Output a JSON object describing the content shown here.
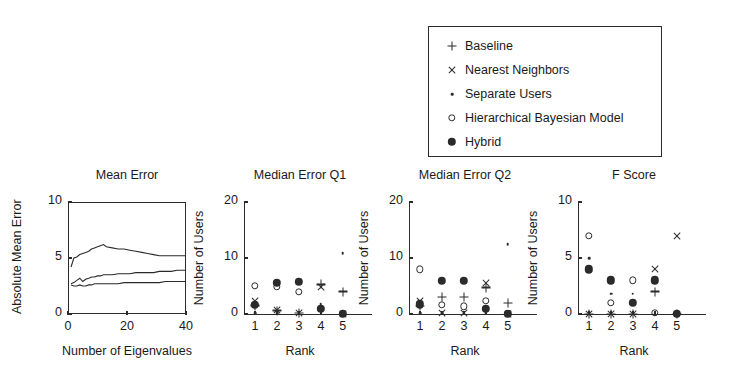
{
  "legend": {
    "items": [
      {
        "marker": "plus-icon",
        "label": "Baseline"
      },
      {
        "marker": "cross-icon",
        "label": "Nearest Neighbors"
      },
      {
        "marker": "dot-icon",
        "label": "Separate Users"
      },
      {
        "marker": "open-circle-icon",
        "label": "Hierarchical Bayesian Model"
      },
      {
        "marker": "filled-circle-icon",
        "label": "Hybrid"
      }
    ]
  },
  "chart_data": [
    {
      "type": "line",
      "title": "Mean Error",
      "xlabel": "Number of Eigenvalues",
      "ylabel": "Absolute Mean Error",
      "xlim": [
        0,
        40
      ],
      "ylim": [
        0,
        10
      ],
      "xticks": [
        0,
        20,
        40
      ],
      "xtick_labels": [
        "0",
        "20",
        "40"
      ],
      "yticks": [
        0,
        5,
        10
      ],
      "ytick_labels": [
        "0",
        "5",
        "10"
      ],
      "grid": false,
      "frame": "box",
      "series": [
        {
          "name": "upper",
          "x": [
            1,
            2,
            3,
            4,
            5,
            6,
            7,
            8,
            9,
            10,
            11,
            12,
            13,
            15,
            17,
            19,
            21,
            23,
            25,
            27,
            29,
            31,
            33,
            35,
            37,
            39,
            40
          ],
          "y": [
            4.2,
            5.0,
            5.1,
            5.3,
            5.4,
            5.5,
            5.6,
            5.8,
            5.9,
            6.0,
            6.1,
            6.2,
            6.0,
            5.9,
            5.8,
            5.8,
            5.7,
            5.6,
            5.5,
            5.4,
            5.3,
            5.2,
            5.2,
            5.2,
            5.2,
            5.2,
            5.2
          ]
        },
        {
          "name": "middle",
          "x": [
            1,
            2,
            3,
            4,
            5,
            6,
            7,
            8,
            9,
            10,
            11,
            12,
            13,
            15,
            17,
            19,
            21,
            23,
            25,
            27,
            29,
            31,
            33,
            35,
            37,
            39,
            40
          ],
          "y": [
            2.7,
            2.8,
            3.0,
            3.2,
            2.9,
            3.1,
            3.2,
            3.3,
            3.3,
            3.4,
            3.4,
            3.5,
            3.5,
            3.5,
            3.6,
            3.6,
            3.6,
            3.7,
            3.7,
            3.7,
            3.7,
            3.8,
            3.8,
            3.8,
            3.9,
            3.9,
            3.9
          ]
        },
        {
          "name": "lower",
          "x": [
            1,
            2,
            3,
            4,
            5,
            6,
            7,
            8,
            9,
            10,
            11,
            12,
            13,
            15,
            17,
            19,
            21,
            23,
            25,
            27,
            29,
            31,
            33,
            35,
            37,
            39,
            40
          ],
          "y": [
            2.6,
            2.5,
            2.5,
            2.6,
            2.5,
            2.5,
            2.6,
            2.6,
            2.7,
            2.7,
            2.7,
            2.7,
            2.7,
            2.7,
            2.7,
            2.8,
            2.8,
            2.8,
            2.8,
            2.8,
            2.8,
            2.8,
            2.9,
            2.9,
            2.9,
            2.9,
            2.9
          ]
        }
      ]
    },
    {
      "type": "scatter",
      "title": "Median Error Q1",
      "xlabel": "Rank",
      "ylabel": "Number of Users",
      "xlim": [
        0.5,
        5.6
      ],
      "ylim": [
        0,
        20
      ],
      "xticks": [
        1,
        2,
        3,
        4,
        5
      ],
      "xtick_labels": [
        "1",
        "2",
        "3",
        "4",
        "5"
      ],
      "yticks": [
        0,
        10,
        20
      ],
      "ytick_labels": [
        "0",
        "10",
        "20"
      ],
      "grid": false,
      "frame": "L",
      "categories": [
        1,
        2,
        3,
        4,
        5
      ],
      "series": [
        {
          "name": "Baseline",
          "marker": "plus-icon",
          "values": [
            1.5,
            0.6,
            0.2,
            5.3,
            4.0
          ]
        },
        {
          "name": "Nearest Neighbors",
          "marker": "cross-icon",
          "values": [
            2.3,
            0.8,
            0.2,
            4.8,
            0.0
          ]
        },
        {
          "name": "Separate Users",
          "marker": "dot-icon",
          "values": [
            0.1,
            0.1,
            0.1,
            1.7,
            10.9
          ]
        },
        {
          "name": "Hierarchical Bayesian Model",
          "marker": "open-circle-icon",
          "values": [
            5.0,
            4.9,
            4.0,
            0.9,
            0.0
          ]
        },
        {
          "name": "Hybrid",
          "marker": "filled-circle-icon",
          "values": [
            1.6,
            5.6,
            5.8,
            0.9,
            0.0
          ]
        }
      ]
    },
    {
      "type": "scatter",
      "title": "Median Error Q2",
      "xlabel": "Rank",
      "ylabel": "Number of Users",
      "xlim": [
        0.5,
        5.6
      ],
      "ylim": [
        0,
        20
      ],
      "xticks": [
        1,
        2,
        3,
        4,
        5
      ],
      "xtick_labels": [
        "1",
        "2",
        "3",
        "4",
        "5"
      ],
      "yticks": [
        0,
        10,
        20
      ],
      "ytick_labels": [
        "0",
        "10",
        "20"
      ],
      "grid": false,
      "frame": "L",
      "categories": [
        1,
        2,
        3,
        4,
        5
      ],
      "series": [
        {
          "name": "Baseline",
          "marker": "plus-icon",
          "values": [
            1.4,
            3.0,
            3.0,
            4.7,
            2.0
          ]
        },
        {
          "name": "Nearest Neighbors",
          "marker": "cross-icon",
          "values": [
            2.3,
            0.1,
            0.1,
            5.5,
            0.0
          ]
        },
        {
          "name": "Separate Users",
          "marker": "dot-icon",
          "values": [
            0.1,
            0.1,
            0.1,
            0.1,
            12.5
          ]
        },
        {
          "name": "Hierarchical Bayesian Model",
          "marker": "open-circle-icon",
          "values": [
            8.0,
            1.6,
            1.4,
            2.4,
            0.0
          ]
        },
        {
          "name": "Hybrid",
          "marker": "filled-circle-icon",
          "values": [
            1.7,
            5.9,
            5.9,
            0.9,
            0.0
          ]
        }
      ]
    },
    {
      "type": "scatter",
      "title": "F Score",
      "xlabel": "Rank",
      "ylabel": "Number of Users",
      "xlim": [
        0.5,
        5.6
      ],
      "ylim": [
        0,
        10
      ],
      "xticks": [
        1,
        2,
        3,
        4,
        5
      ],
      "xtick_labels": [
        "1",
        "2",
        "3",
        "4",
        "5"
      ],
      "yticks": [
        0,
        5,
        10
      ],
      "ytick_labels": [
        "0",
        "5",
        "10"
      ],
      "grid": false,
      "frame": "L",
      "categories": [
        1,
        2,
        3,
        4,
        5
      ],
      "series": [
        {
          "name": "Baseline",
          "marker": "plus-icon",
          "values": [
            0.0,
            0.0,
            0.0,
            2.0,
            0.0
          ]
        },
        {
          "name": "Nearest Neighbors",
          "marker": "cross-icon",
          "values": [
            0.0,
            0.0,
            0.0,
            4.0,
            7.0
          ]
        },
        {
          "name": "Separate Users",
          "marker": "dot-icon",
          "values": [
            5.0,
            1.8,
            1.8,
            0.0,
            0.0
          ]
        },
        {
          "name": "Hierarchical Bayesian Model",
          "marker": "open-circle-icon",
          "values": [
            7.0,
            1.0,
            3.0,
            0.1,
            0.0
          ]
        },
        {
          "name": "Hybrid",
          "marker": "filled-circle-icon",
          "values": [
            4.0,
            3.0,
            1.0,
            3.0,
            0.0
          ]
        }
      ]
    }
  ]
}
